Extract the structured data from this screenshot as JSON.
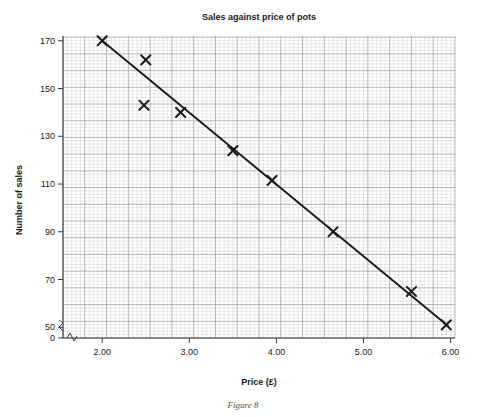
{
  "figure": {
    "caption": "Figure 8"
  },
  "chart_data": {
    "type": "scatter",
    "title": "Sales against price of pots",
    "xlabel": "Price (£)",
    "ylabel": "Number of sales",
    "xlim": [
      1.55,
      6.05
    ],
    "ylim": [
      45.5,
      172
    ],
    "x_ticks": [
      "2.00",
      "3.00",
      "4.00",
      "5.00",
      "6.00"
    ],
    "x_tick_values": [
      2.0,
      3.0,
      4.0,
      5.0,
      6.0
    ],
    "y_ticks": [
      "170",
      "150",
      "130",
      "110",
      "90",
      "70",
      "50",
      "0"
    ],
    "y_tick_values": [
      170,
      150,
      130,
      110,
      90,
      70,
      50
    ],
    "y_axis_break": true,
    "y_zero_label": "0",
    "grid": "graph-paper",
    "grid_minor_step_x": 0.05,
    "grid_minor_step_y": 1.4,
    "grid_major_every": 5,
    "marker": "cross",
    "legend": null,
    "points": [
      {
        "x": 2.0,
        "y": 170
      },
      {
        "x": 2.5,
        "y": 162
      },
      {
        "x": 2.48,
        "y": 143
      },
      {
        "x": 2.9,
        "y": 140
      },
      {
        "x": 3.5,
        "y": 124
      },
      {
        "x": 3.95,
        "y": 111.5
      },
      {
        "x": 4.65,
        "y": 90
      },
      {
        "x": 5.55,
        "y": 65
      },
      {
        "x": 5.95,
        "y": 51
      }
    ],
    "trend_line": {
      "type": "line-of-best-fit",
      "x1": 2.0,
      "y1": 170,
      "x2": 5.97,
      "y2": 50.5
    },
    "colors": {
      "ink": "#1a1a1a",
      "grid_minor": "#c9c9c9",
      "grid_major": "#9a9a9a",
      "axis": "#3a3a3a",
      "background": "#ffffff"
    }
  }
}
